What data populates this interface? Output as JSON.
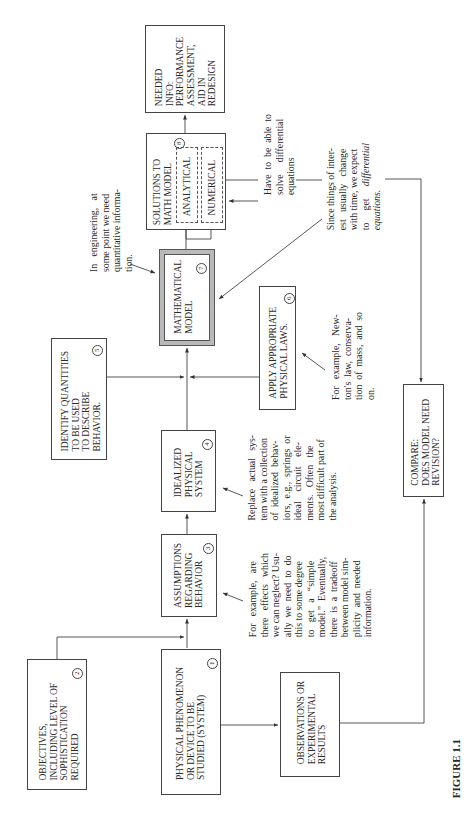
{
  "figure": {
    "caption": "FIGURE 1.1",
    "orientation": "rotated 90° counterclockwise"
  },
  "boxes": {
    "physical": {
      "number": "1",
      "text": "PHYSICAL PHENOMENON\nOR DEVICE TO BE\nSTUDIED (SYSTEM)"
    },
    "objectives": {
      "number": "2",
      "text": "OBJECTIVES,\nINCLUDING LEVEL OF\nSOPHISTICATION\nREQUIRED"
    },
    "assumptions": {
      "number": "3",
      "text": "ASSUMPTIONS\nREGARDING\nBEHAVIOR"
    },
    "idealized": {
      "number": "4",
      "text": "IDEALIZED\nPHYSICAL\nSYSTEM"
    },
    "identify": {
      "number": "5",
      "text": "IDENTIFY QUANTITIES\nTO BE USED\nTO DESCRIBE\nBEHAVIOR."
    },
    "laws": {
      "number": "6",
      "text": "APPLY APPROPRIATE\nPHYSICAL LAWS."
    },
    "math_model": {
      "number": "7",
      "text": "MATHEMATICAL\nMODEL"
    },
    "solutions": {
      "number": "8",
      "text": "SOLUTIONS TO\nMATH MODEL",
      "sub": [
        "ANALYTICAL",
        "NUMERICAL"
      ]
    },
    "needed_info": {
      "text": "NEEDED\nINFO:\nPERFORMANCE\nASSESSMENT,\nAID IN\nREDESIGN"
    },
    "observations": {
      "text": "OBSERVATIONS OR\nEXPERIMENTAL\nRESULTS"
    },
    "compare": {
      "text": "COMPARE:\nDOES MODEL NEED\nREVISION?"
    }
  },
  "notes": {
    "engineering": "In   engineering,   at\nsome point we need\nquantitative informa-\ntion.",
    "assumptions": "For   example,   are\nthere   effects   which\nwe can neglect? Usu-\nally  we  need  to  do\nthis to some degree\nto   get   a   “simple\nmodel.”  Eventually,\nthere  is  a  tradeoff\nbetween model sim-\nplicity  and  needed\ninformation.",
    "idealized": "Replace   actual   sys-\ntem with a collection\nof  idealized  behav-\niors,  e.g.,  springs  or\nideal    circuit    ele-\nments.   Often   the\nmost difficult part of\nthe analysis.",
    "laws": "For   example,   New-\nton's  law,  conserva-\ntion  of  mass,  and  so\non.",
    "differential": "Have  to  be  able  to\nsolve     differential\nequations",
    "change_prefix": "Since things of inter-\nest   usually   change\nwith time, we expect\nto     get     ",
    "change_italic_1": "differential",
    "change_italic_2": "equations."
  }
}
